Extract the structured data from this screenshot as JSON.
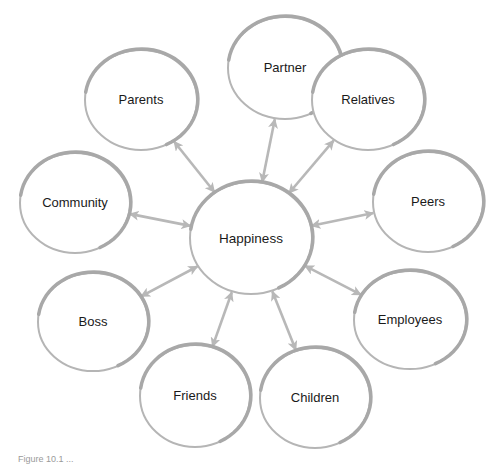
{
  "diagram": {
    "type": "radial-relationship-diagram",
    "colors": {
      "stroke": "#b5b5b5",
      "stroke_shadow": "#a8a8a8",
      "fill": "#ffffff",
      "text": "#1a1a1a",
      "background": "#ffffff"
    },
    "center": {
      "label": "Happiness",
      "cx": 251,
      "cy": 238,
      "rx": 61,
      "ry": 56
    },
    "nodes": [
      {
        "label": "Partner",
        "cx": 285,
        "cy": 68,
        "rx": 57,
        "ry": 51
      },
      {
        "label": "Relatives",
        "cx": 368,
        "cy": 100,
        "rx": 56,
        "ry": 50
      },
      {
        "label": "Peers",
        "cx": 428,
        "cy": 202,
        "rx": 55,
        "ry": 50
      },
      {
        "label": "Employees",
        "cx": 410,
        "cy": 320,
        "rx": 56,
        "ry": 49
      },
      {
        "label": "Children",
        "cx": 315,
        "cy": 398,
        "rx": 55,
        "ry": 50
      },
      {
        "label": "Friends",
        "cx": 195,
        "cy": 396,
        "rx": 55,
        "ry": 51
      },
      {
        "label": "Boss",
        "cx": 93,
        "cy": 322,
        "rx": 55,
        "ry": 49
      },
      {
        "label": "Community",
        "cx": 75,
        "cy": 203,
        "rx": 55,
        "ry": 50
      },
      {
        "label": "Parents",
        "cx": 141,
        "cy": 100,
        "rx": 56,
        "ry": 50
      }
    ],
    "edges_bidirectional": true
  },
  "caption": {
    "text": "Figure 10.1 ..."
  }
}
